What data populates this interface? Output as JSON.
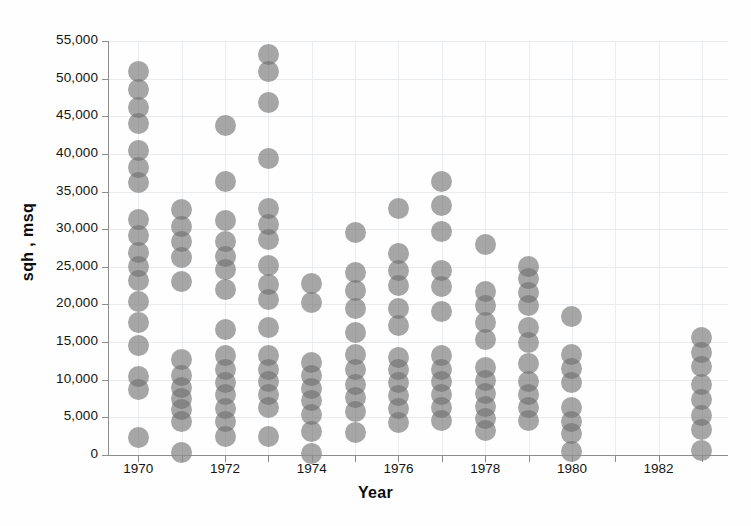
{
  "chart_data": {
    "type": "scatter",
    "title": "",
    "xlabel": "Year",
    "ylabel": "sqh , msq",
    "xlim": [
      1969.3,
      1983.6
    ],
    "ylim": [
      0,
      55000
    ],
    "grid": true,
    "legend": "none",
    "marker": {
      "shape": "circle",
      "size_px": 21,
      "opacity": 0.62,
      "color": "#6f6f6f"
    },
    "x_tick_labels": [
      "1970",
      "1972",
      "1974",
      "1976",
      "1978",
      "1980",
      "1982"
    ],
    "x_tick_values": [
      1970,
      1972,
      1974,
      1976,
      1978,
      1980,
      1982
    ],
    "x_minor_ticks": [
      1971,
      1973,
      1975,
      1977,
      1979,
      1981,
      1983
    ],
    "y_tick_labels": [
      "0",
      "5,000",
      "10,000",
      "15,000",
      "20,000",
      "25,000",
      "30,000",
      "35,000",
      "40,000",
      "45,000",
      "50,000",
      "55,000"
    ],
    "y_tick_values": [
      0,
      5000,
      10000,
      15000,
      20000,
      25000,
      30000,
      35000,
      40000,
      45000,
      50000,
      55000
    ],
    "series": [
      {
        "name": "observations",
        "points": [
          {
            "x": 1970,
            "y": 51000
          },
          {
            "x": 1970,
            "y": 48600
          },
          {
            "x": 1970,
            "y": 46200
          },
          {
            "x": 1970,
            "y": 44000
          },
          {
            "x": 1970,
            "y": 40400
          },
          {
            "x": 1970,
            "y": 38200
          },
          {
            "x": 1970,
            "y": 36200
          },
          {
            "x": 1970,
            "y": 31300
          },
          {
            "x": 1970,
            "y": 29100
          },
          {
            "x": 1970,
            "y": 26900
          },
          {
            "x": 1970,
            "y": 25000
          },
          {
            "x": 1970,
            "y": 23200
          },
          {
            "x": 1970,
            "y": 20400
          },
          {
            "x": 1970,
            "y": 17600
          },
          {
            "x": 1970,
            "y": 14600
          },
          {
            "x": 1970,
            "y": 10400
          },
          {
            "x": 1970,
            "y": 8700
          },
          {
            "x": 1970,
            "y": 2300
          },
          {
            "x": 1971,
            "y": 32600
          },
          {
            "x": 1971,
            "y": 30400
          },
          {
            "x": 1971,
            "y": 28300
          },
          {
            "x": 1971,
            "y": 26300
          },
          {
            "x": 1971,
            "y": 23000
          },
          {
            "x": 1971,
            "y": 12700
          },
          {
            "x": 1971,
            "y": 10600
          },
          {
            "x": 1971,
            "y": 9000
          },
          {
            "x": 1971,
            "y": 7500
          },
          {
            "x": 1971,
            "y": 6000
          },
          {
            "x": 1971,
            "y": 4400
          },
          {
            "x": 1971,
            "y": 300
          },
          {
            "x": 1972,
            "y": 43800
          },
          {
            "x": 1972,
            "y": 36300
          },
          {
            "x": 1972,
            "y": 31100
          },
          {
            "x": 1972,
            "y": 28300
          },
          {
            "x": 1972,
            "y": 26400
          },
          {
            "x": 1972,
            "y": 24600
          },
          {
            "x": 1972,
            "y": 22000
          },
          {
            "x": 1972,
            "y": 16700
          },
          {
            "x": 1972,
            "y": 13200
          },
          {
            "x": 1972,
            "y": 11300
          },
          {
            "x": 1972,
            "y": 9600
          },
          {
            "x": 1972,
            "y": 8000
          },
          {
            "x": 1972,
            "y": 6200
          },
          {
            "x": 1972,
            "y": 4500
          },
          {
            "x": 1972,
            "y": 2400
          },
          {
            "x": 1973,
            "y": 53200
          },
          {
            "x": 1973,
            "y": 51000
          },
          {
            "x": 1973,
            "y": 46800
          },
          {
            "x": 1973,
            "y": 39400
          },
          {
            "x": 1973,
            "y": 32700
          },
          {
            "x": 1973,
            "y": 30600
          },
          {
            "x": 1973,
            "y": 28600
          },
          {
            "x": 1973,
            "y": 25200
          },
          {
            "x": 1973,
            "y": 22600
          },
          {
            "x": 1973,
            "y": 20600
          },
          {
            "x": 1973,
            "y": 17000
          },
          {
            "x": 1973,
            "y": 13200
          },
          {
            "x": 1973,
            "y": 11400
          },
          {
            "x": 1973,
            "y": 9700
          },
          {
            "x": 1973,
            "y": 8000
          },
          {
            "x": 1973,
            "y": 6300
          },
          {
            "x": 1973,
            "y": 2500
          },
          {
            "x": 1974,
            "y": 22800
          },
          {
            "x": 1974,
            "y": 20300
          },
          {
            "x": 1974,
            "y": 12300
          },
          {
            "x": 1974,
            "y": 10600
          },
          {
            "x": 1974,
            "y": 8800
          },
          {
            "x": 1974,
            "y": 7200
          },
          {
            "x": 1974,
            "y": 5400
          },
          {
            "x": 1974,
            "y": 3100
          },
          {
            "x": 1974,
            "y": 200
          },
          {
            "x": 1975,
            "y": 29600
          },
          {
            "x": 1975,
            "y": 24300
          },
          {
            "x": 1975,
            "y": 21900
          },
          {
            "x": 1975,
            "y": 19400
          },
          {
            "x": 1975,
            "y": 16300
          },
          {
            "x": 1975,
            "y": 13300
          },
          {
            "x": 1975,
            "y": 11400
          },
          {
            "x": 1975,
            "y": 9400
          },
          {
            "x": 1975,
            "y": 7600
          },
          {
            "x": 1975,
            "y": 5800
          },
          {
            "x": 1975,
            "y": 3000
          },
          {
            "x": 1976,
            "y": 32800
          },
          {
            "x": 1976,
            "y": 26800
          },
          {
            "x": 1976,
            "y": 24500
          },
          {
            "x": 1976,
            "y": 22500
          },
          {
            "x": 1976,
            "y": 19400
          },
          {
            "x": 1976,
            "y": 17200
          },
          {
            "x": 1976,
            "y": 13000
          },
          {
            "x": 1976,
            "y": 11300
          },
          {
            "x": 1976,
            "y": 9600
          },
          {
            "x": 1976,
            "y": 7900
          },
          {
            "x": 1976,
            "y": 6200
          },
          {
            "x": 1976,
            "y": 4300
          },
          {
            "x": 1977,
            "y": 36400
          },
          {
            "x": 1977,
            "y": 33200
          },
          {
            "x": 1977,
            "y": 29700
          },
          {
            "x": 1977,
            "y": 24500
          },
          {
            "x": 1977,
            "y": 22400
          },
          {
            "x": 1977,
            "y": 19000
          },
          {
            "x": 1977,
            "y": 13200
          },
          {
            "x": 1977,
            "y": 11400
          },
          {
            "x": 1977,
            "y": 9700
          },
          {
            "x": 1977,
            "y": 8000
          },
          {
            "x": 1977,
            "y": 6300
          },
          {
            "x": 1977,
            "y": 4600
          },
          {
            "x": 1978,
            "y": 27900
          },
          {
            "x": 1978,
            "y": 21700
          },
          {
            "x": 1978,
            "y": 19800
          },
          {
            "x": 1978,
            "y": 17600
          },
          {
            "x": 1978,
            "y": 15400
          },
          {
            "x": 1978,
            "y": 11600
          },
          {
            "x": 1978,
            "y": 9900
          },
          {
            "x": 1978,
            "y": 8200
          },
          {
            "x": 1978,
            "y": 6500
          },
          {
            "x": 1978,
            "y": 4800
          },
          {
            "x": 1978,
            "y": 3300
          },
          {
            "x": 1979,
            "y": 25100
          },
          {
            "x": 1979,
            "y": 23400
          },
          {
            "x": 1979,
            "y": 21600
          },
          {
            "x": 1979,
            "y": 19800
          },
          {
            "x": 1979,
            "y": 17000
          },
          {
            "x": 1979,
            "y": 15000
          },
          {
            "x": 1979,
            "y": 12100
          },
          {
            "x": 1979,
            "y": 9700
          },
          {
            "x": 1979,
            "y": 8000
          },
          {
            "x": 1979,
            "y": 6300
          },
          {
            "x": 1979,
            "y": 4600
          },
          {
            "x": 1980,
            "y": 18400
          },
          {
            "x": 1980,
            "y": 13400
          },
          {
            "x": 1980,
            "y": 11500
          },
          {
            "x": 1980,
            "y": 9600
          },
          {
            "x": 1980,
            "y": 6300
          },
          {
            "x": 1980,
            "y": 4500
          },
          {
            "x": 1980,
            "y": 2800
          },
          {
            "x": 1980,
            "y": 400
          },
          {
            "x": 1983,
            "y": 15600
          },
          {
            "x": 1983,
            "y": 13600
          },
          {
            "x": 1983,
            "y": 11700
          },
          {
            "x": 1983,
            "y": 9400
          },
          {
            "x": 1983,
            "y": 7400
          },
          {
            "x": 1983,
            "y": 5300
          },
          {
            "x": 1983,
            "y": 3400
          },
          {
            "x": 1983,
            "y": 600
          }
        ]
      }
    ]
  }
}
